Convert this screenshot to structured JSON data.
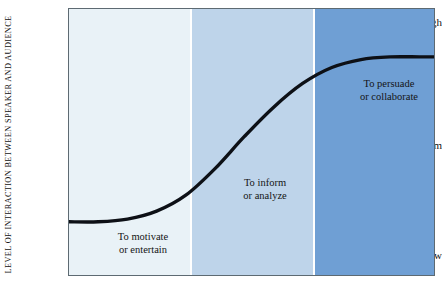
{
  "figure": {
    "y_axis_title": "LEVEL OF INTERACTION BETWEEN SPEAKER AND AUDIENCE",
    "y_ticks": [
      {
        "label": "High"
      },
      {
        "label": "Medium"
      },
      {
        "label": "Low"
      }
    ],
    "zones": [
      {
        "line1": "To motivate",
        "line2": "or entertain",
        "color": "#e9f2f7"
      },
      {
        "line1": "To inform",
        "line2": "or analyze",
        "color": "#bed4ea"
      },
      {
        "line1": "To persuade",
        "line2": "or collaborate",
        "color": "#6f9fd4"
      }
    ],
    "curve_color": "#0d1016",
    "frame_color": "#5d6a72",
    "separator_color": "#ffffff"
  },
  "chart_data": {
    "type": "line",
    "title": "",
    "xlabel": "",
    "ylabel": "LEVEL OF INTERACTION BETWEEN SPEAKER AND AUDIENCE",
    "grid": false,
    "legend": "none",
    "ytick_labels": [
      "Low",
      "Medium",
      "High"
    ],
    "ylim": [
      0,
      100
    ],
    "xlim": [
      0,
      100
    ],
    "band_boundaries": [
      33,
      67
    ],
    "bands": [
      {
        "name": "To motivate or entertain",
        "x_range": [
          0,
          33
        ],
        "color": "#e9f2f7"
      },
      {
        "name": "To inform or analyze",
        "x_range": [
          33,
          67
        ],
        "color": "#bed4ea"
      },
      {
        "name": "To persuade or collaborate",
        "x_range": [
          67,
          100
        ],
        "color": "#6f9fd4"
      }
    ],
    "series": [
      {
        "name": "Interaction level",
        "x": [
          0,
          8,
          16,
          24,
          32,
          40,
          48,
          56,
          64,
          72,
          80,
          88,
          96,
          100
        ],
        "y": [
          20,
          20,
          21,
          24,
          30,
          40,
          52,
          63,
          72,
          78,
          81,
          82,
          82,
          82
        ]
      }
    ]
  }
}
